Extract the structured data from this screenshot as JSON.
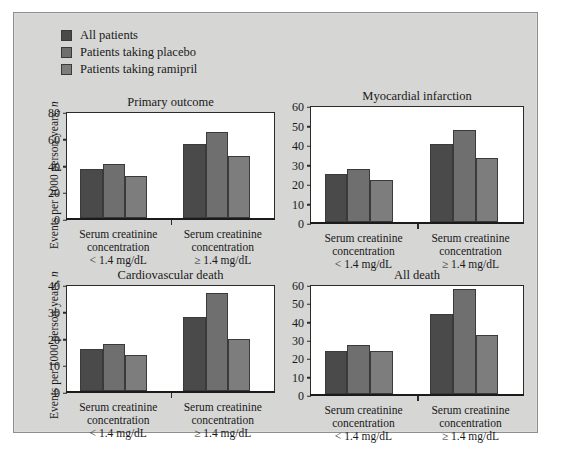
{
  "figure": {
    "background_color": "#d6d6d4",
    "border_color": "#8e8e8c"
  },
  "legend": {
    "items": [
      {
        "label": "All patients",
        "color": "#4a4a4a"
      },
      {
        "label": "Patients taking placebo",
        "color": "#6f6f6f"
      },
      {
        "label": "Patients taking ramipril",
        "color": "#7d7d7d"
      }
    ]
  },
  "axis": {
    "ylabel_prefix": "Events per 1000 person-years, ",
    "ylabel_italic": "n"
  },
  "chart_data": [
    {
      "type": "bar",
      "title": "Primary outcome",
      "xlabel": "",
      "ylabel": "Events per 1000 person-years, n",
      "ylim": [
        0,
        80
      ],
      "yticks": [
        0,
        20,
        40,
        60,
        80
      ],
      "grid": false,
      "legend_position": "top-left (shared)",
      "categories": [
        "Serum creatinine concentration < 1.4 mg/dL",
        "Serum creatinine concentration ≥ 1.4 mg/dL"
      ],
      "category_lines": [
        [
          "Serum creatinine",
          "concentration",
          "< 1.4 mg/dL"
        ],
        [
          "Serum creatinine",
          "concentration",
          "≥ 1.4 mg/dL"
        ]
      ],
      "series": [
        {
          "name": "All patients",
          "values": [
            37,
            56
          ]
        },
        {
          "name": "Patients taking placebo",
          "values": [
            41,
            65
          ]
        },
        {
          "name": "Patients taking ramipril",
          "values": [
            32,
            47
          ]
        }
      ]
    },
    {
      "type": "bar",
      "title": "Myocardial infarction",
      "xlabel": "",
      "ylabel": "Events per 1000 person-years, n",
      "ylim": [
        0,
        60
      ],
      "yticks": [
        0,
        10,
        20,
        30,
        40,
        50,
        60
      ],
      "grid": false,
      "legend_position": "top-left (shared)",
      "categories": [
        "Serum creatinine concentration < 1.4 mg/dL",
        "Serum creatinine concentration ≥ 1.4 mg/dL"
      ],
      "category_lines": [
        [
          "Serum creatinine",
          "concentration",
          "< 1.4 mg/dL"
        ],
        [
          "Serum creatinine",
          "concentration",
          "≥ 1.4 mg/dL"
        ]
      ],
      "series": [
        {
          "name": "All patients",
          "values": [
            25,
            40.5
          ]
        },
        {
          "name": "Patients taking placebo",
          "values": [
            27.5,
            48
          ]
        },
        {
          "name": "Patients taking ramipril",
          "values": [
            22,
            33.5
          ]
        }
      ]
    },
    {
      "type": "bar",
      "title": "Cardiovascular death",
      "xlabel": "",
      "ylabel": "Events per 1000 person-years, n",
      "ylim": [
        0,
        40
      ],
      "yticks": [
        0,
        10,
        20,
        30,
        40
      ],
      "grid": false,
      "legend_position": "top-left (shared)",
      "categories": [
        "Serum creatinine concentration < 1.4 mg/dL",
        "Serum creatinine concentration ≥ 1.4 mg/dL"
      ],
      "category_lines": [
        [
          "Serum creatinine",
          "concentration",
          "< 1.4 mg/dL"
        ],
        [
          "Serum creatinine",
          "concentration",
          "≥ 1.4 mg/dL"
        ]
      ],
      "series": [
        {
          "name": "All patients",
          "values": [
            16,
            28
          ]
        },
        {
          "name": "Patients taking placebo",
          "values": [
            18,
            37
          ]
        },
        {
          "name": "Patients taking ramipril",
          "values": [
            13.5,
            19.7
          ]
        }
      ]
    },
    {
      "type": "bar",
      "title": "All death",
      "xlabel": "",
      "ylabel": "Events per 1000 person-years, n",
      "ylim": [
        0,
        60
      ],
      "yticks": [
        0,
        10,
        20,
        30,
        40,
        50,
        60
      ],
      "grid": false,
      "legend_position": "top-left (shared)",
      "categories": [
        "Serum creatinine concentration < 1.4 mg/dL",
        "Serum creatinine concentration ≥ 1.4 mg/dL"
      ],
      "category_lines": [
        [
          "Serum creatinine",
          "concentration",
          "< 1.4 mg/dL"
        ],
        [
          "Serum creatinine",
          "concentration",
          "≥ 1.4 mg/dL"
        ]
      ],
      "series": [
        {
          "name": "All patients",
          "values": [
            24,
            44
          ]
        },
        {
          "name": "Patients taking placebo",
          "values": [
            27,
            58
          ]
        },
        {
          "name": "Patients taking ramipril",
          "values": [
            24,
            32.5
          ]
        }
      ]
    }
  ]
}
